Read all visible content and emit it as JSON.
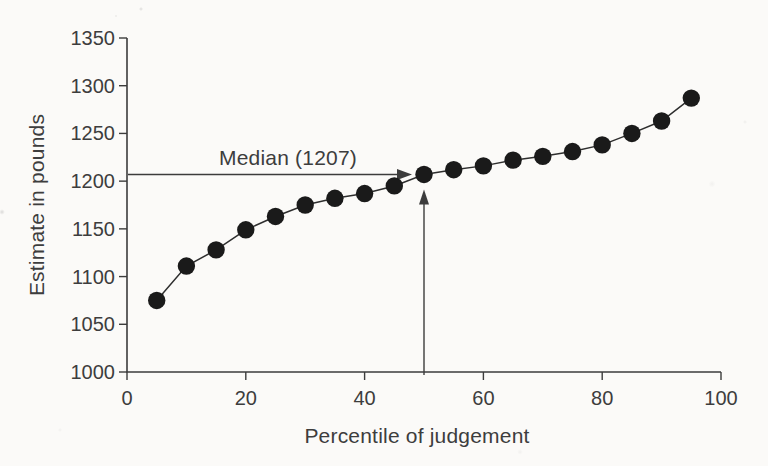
{
  "page": {
    "background_color": "#fbfaf8"
  },
  "chart_data": {
    "type": "line",
    "title": "",
    "xlabel": "Percentile of judgement",
    "ylabel": "Estimate in pounds",
    "x": [
      5,
      10,
      15,
      20,
      25,
      30,
      35,
      40,
      45,
      50,
      55,
      60,
      65,
      70,
      75,
      80,
      85,
      90,
      95
    ],
    "y": [
      1075,
      1111,
      1128,
      1149,
      1163,
      1175,
      1182,
      1187,
      1195,
      1207,
      1212,
      1216,
      1222,
      1226,
      1231,
      1238,
      1250,
      1263,
      1287
    ],
    "xlim": [
      0,
      100
    ],
    "ylim": [
      1000,
      1350
    ],
    "xticks": [
      0,
      20,
      40,
      60,
      80,
      100
    ],
    "yticks": [
      1000,
      1050,
      1100,
      1150,
      1200,
      1250,
      1300,
      1350
    ],
    "grid": false,
    "legend": "none",
    "marker_color": "#1a1a1a",
    "line_color": "#2e2e2e",
    "axis_color": "#3c3c3c",
    "text_color": "#3d3d3d",
    "annotation": {
      "label": "Median (1207)",
      "value": 1207,
      "percentile": 50
    }
  }
}
